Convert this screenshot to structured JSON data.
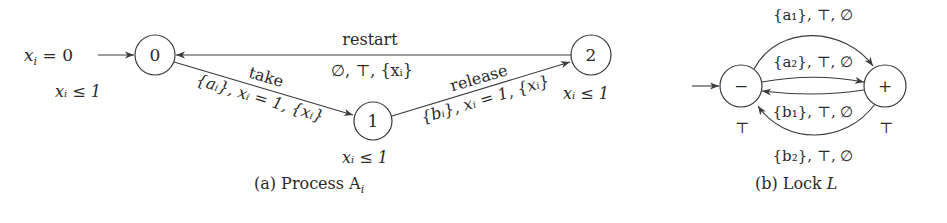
{
  "figure_a": {
    "caption": "(a) Process A",
    "caption_sub": "i",
    "initial_label": "x",
    "initial_label_sub": "i",
    "initial_label_rest": " = 0",
    "nodes": [
      {
        "id": "0",
        "label": "0",
        "invariant": "xᵢ ≤ 1"
      },
      {
        "id": "1",
        "label": "1",
        "invariant": "xᵢ ≤ 1"
      },
      {
        "id": "2",
        "label": "2",
        "invariant": "xᵢ ≤ 1"
      }
    ],
    "edges": [
      {
        "from": "0",
        "to": "1",
        "name": "take",
        "guard": "{aᵢ}, xᵢ = 1, {xᵢ}"
      },
      {
        "from": "1",
        "to": "2",
        "name": "release",
        "guard": "{bᵢ}, xᵢ = 1, {xᵢ}"
      },
      {
        "from": "2",
        "to": "0",
        "name": "restart",
        "guard": "∅, ⊤, {xᵢ}"
      }
    ]
  },
  "figure_b": {
    "caption": "(b) Lock ",
    "caption_var": "L",
    "nodes": [
      {
        "id": "minus",
        "label": "−",
        "invariant": "⊤"
      },
      {
        "id": "plus",
        "label": "+",
        "invariant": "⊤"
      }
    ],
    "edges": [
      {
        "from": "minus",
        "to": "plus",
        "label": "{a₁}, ⊤, ∅"
      },
      {
        "from": "minus",
        "to": "plus",
        "label": "{a₂}, ⊤, ∅"
      },
      {
        "from": "plus",
        "to": "minus",
        "label": "{b₁}, ⊤, ∅"
      },
      {
        "from": "plus",
        "to": "minus",
        "label": "{b₂}, ⊤, ∅"
      }
    ]
  }
}
